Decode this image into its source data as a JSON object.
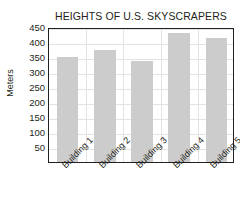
{
  "chart_data": {
    "type": "bar",
    "title": "HEIGHTS OF U.S. SKYSCRAPERS",
    "xlabel": "",
    "ylabel": "Meters",
    "categories": [
      "Building 1",
      "Building 2",
      "Building 3",
      "Building 4",
      "Building 5"
    ],
    "values": [
      350,
      375,
      337,
      430,
      415
    ],
    "ylim": [
      0,
      450
    ],
    "ytick_labels": [
      "450",
      "400",
      "350",
      "300",
      "250",
      "200",
      "150",
      "100",
      "50"
    ],
    "ytick_values": [
      450,
      400,
      350,
      300,
      250,
      200,
      150,
      100,
      50
    ],
    "grid": true,
    "legend": false,
    "bar_color": "#cccccc",
    "axis_color": "#231f20",
    "grid_color": "#e3e3e3",
    "background_color": "#ffffff"
  }
}
